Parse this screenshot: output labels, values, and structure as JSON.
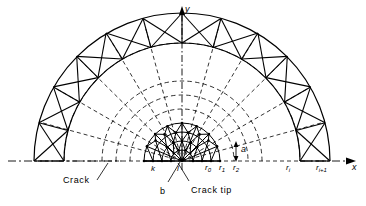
{
  "figure": {
    "type": "engineering-mesh-diagram",
    "background_color": "#ffffff",
    "line_color": "#000000"
  },
  "axes": {
    "x_label": "x",
    "y_label": "y",
    "origin_label": ""
  },
  "annotations": {
    "crack": "Crack",
    "crack_tip": "Crack tip",
    "b": "b",
    "alpha": "a",
    "k": "k",
    "l": "l"
  },
  "radii_labels": [
    {
      "name": "r0",
      "base": "r",
      "sub": "0"
    },
    {
      "name": "r1",
      "base": "r",
      "sub": "1"
    },
    {
      "name": "r2",
      "base": "r",
      "sub": "2"
    },
    {
      "name": "ri",
      "base": "r",
      "sub": "i"
    },
    {
      "name": "ri1",
      "base": "r",
      "sub": "i+1"
    }
  ],
  "geometry": {
    "center_x": 182,
    "baseline_y": 161,
    "radii": [
      38,
      52,
      66,
      80,
      118,
      148
    ],
    "sector_count": 12,
    "alpha_degrees": 15
  }
}
